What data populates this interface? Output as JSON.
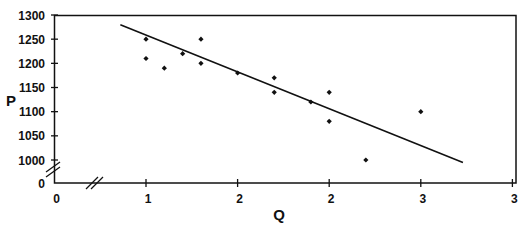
{
  "chart_data": {
    "type": "scatter",
    "title": "",
    "xlabel": "Q",
    "ylabel": "P",
    "x_tick_labels": [
      "0",
      "1",
      "2",
      "2",
      "3",
      "3"
    ],
    "x_tick_values": [
      0,
      1.0,
      1.5,
      2.0,
      2.5,
      3.0
    ],
    "y_tick_labels": [
      "0",
      "1000",
      "1050",
      "1100",
      "1150",
      "1200",
      "1250",
      "1300"
    ],
    "y_tick_values": [
      0,
      1000,
      1050,
      1100,
      1150,
      1200,
      1250,
      1300
    ],
    "xlim": [
      0,
      3.0
    ],
    "ylim": [
      0,
      1300
    ],
    "axis_breaks": {
      "x": true,
      "y": true
    },
    "grid": false,
    "legend": null,
    "series": [
      {
        "name": "observations",
        "marker": "diamond",
        "color": "#111111",
        "points": [
          {
            "x": 1.0,
            "y": 1250
          },
          {
            "x": 1.0,
            "y": 1210
          },
          {
            "x": 1.1,
            "y": 1190
          },
          {
            "x": 1.2,
            "y": 1220
          },
          {
            "x": 1.3,
            "y": 1250
          },
          {
            "x": 1.3,
            "y": 1200
          },
          {
            "x": 1.5,
            "y": 1180
          },
          {
            "x": 1.7,
            "y": 1170
          },
          {
            "x": 1.7,
            "y": 1140
          },
          {
            "x": 1.9,
            "y": 1120
          },
          {
            "x": 2.0,
            "y": 1140
          },
          {
            "x": 2.0,
            "y": 1080
          },
          {
            "x": 2.2,
            "y": 1000
          },
          {
            "x": 2.5,
            "y": 1100
          }
        ]
      }
    ],
    "trendline": {
      "name": "fitted demand line",
      "color": "#111111",
      "start": {
        "x": 0.86,
        "y": 1280
      },
      "end": {
        "x": 2.73,
        "y": 995
      }
    }
  },
  "colors": {
    "axis": "#111111",
    "background": "#ffffff"
  }
}
